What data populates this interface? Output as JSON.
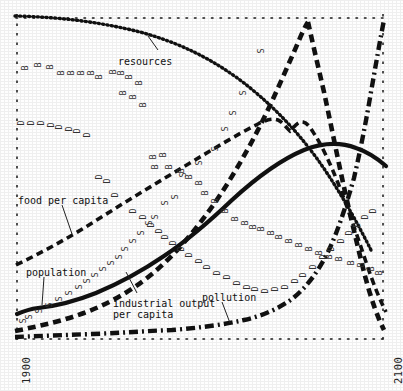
{
  "figure": {
    "title_visible": false,
    "background": "#fefefe",
    "ink": "#111111"
  },
  "axes": {
    "x_left_label": "1900",
    "x_right_label": "2100",
    "frame_style": "dotted"
  },
  "curve_labels": [
    {
      "key": "resources",
      "text": "resources",
      "x": 118,
      "y": 56
    },
    {
      "key": "food",
      "text": "food per capita",
      "x": 18,
      "y": 195
    },
    {
      "key": "population",
      "text": "population",
      "x": 26,
      "y": 267
    },
    {
      "key": "industrial",
      "text": "industrial output\nper capita",
      "x": 113,
      "y": 298
    },
    {
      "key": "pollution",
      "text": "pollution",
      "x": 202,
      "y": 292
    }
  ],
  "chart_data": {
    "type": "line",
    "xlabel": "",
    "ylabel": "",
    "xlim": [
      1900,
      2100
    ],
    "ylim": [
      0,
      1
    ],
    "grid": false,
    "legend": "inline-annotations",
    "x_tick_labels": [
      "1900",
      "2100"
    ],
    "x": [
      1900,
      1910,
      1920,
      1930,
      1940,
      1950,
      1960,
      1970,
      1980,
      1990,
      2000,
      2010,
      2020,
      2030,
      2040,
      2050,
      2060,
      2070,
      2080,
      2090,
      2100
    ],
    "series": [
      {
        "name": "resources",
        "style": "dotted",
        "label_text": "resources",
        "values": [
          0.98,
          0.975,
          0.97,
          0.963,
          0.955,
          0.945,
          0.932,
          0.915,
          0.893,
          0.865,
          0.83,
          0.785,
          0.73,
          0.665,
          0.59,
          0.505,
          0.415,
          0.325,
          0.245,
          0.18,
          0.13
        ]
      },
      {
        "name": "food per capita",
        "style": "dashed",
        "label_text": "food per capita",
        "values": [
          0.215,
          0.245,
          0.275,
          0.308,
          0.342,
          0.378,
          0.415,
          0.452,
          0.49,
          0.528,
          0.565,
          0.6,
          0.635,
          0.668,
          0.7,
          0.695,
          0.72,
          0.6,
          0.4,
          0.22,
          0.1
        ]
      },
      {
        "name": "population",
        "style": "solid",
        "label_text": "population",
        "values": [
          0.095,
          0.1,
          0.107,
          0.116,
          0.128,
          0.143,
          0.163,
          0.188,
          0.218,
          0.255,
          0.3,
          0.352,
          0.41,
          0.472,
          0.533,
          0.586,
          0.622,
          0.638,
          0.632,
          0.612,
          0.585
        ]
      },
      {
        "name": "industrial output per capita",
        "style": "dashed",
        "label_text": "industrial output per capita",
        "values": [
          0.035,
          0.045,
          0.058,
          0.073,
          0.092,
          0.115,
          0.143,
          0.178,
          0.222,
          0.277,
          0.345,
          0.43,
          0.535,
          0.66,
          0.79,
          0.9,
          0.96,
          0.86,
          0.6,
          0.33,
          0.14
        ]
      },
      {
        "name": "pollution",
        "style": "dash-dot",
        "label_text": "pollution",
        "values": [
          0.018,
          0.018,
          0.019,
          0.02,
          0.021,
          0.023,
          0.025,
          0.028,
          0.031,
          0.036,
          0.042,
          0.05,
          0.062,
          0.082,
          0.115,
          0.17,
          0.26,
          0.4,
          0.6,
          0.82,
          0.97
        ]
      }
    ],
    "scatter_markers": [
      {
        "letter": "B",
        "meaning": "crude birth rate",
        "count": 32
      },
      {
        "letter": "D",
        "meaning": "crude death rate",
        "count": 32
      },
      {
        "letter": "S",
        "meaning": "services per capita",
        "count": 22
      }
    ]
  }
}
